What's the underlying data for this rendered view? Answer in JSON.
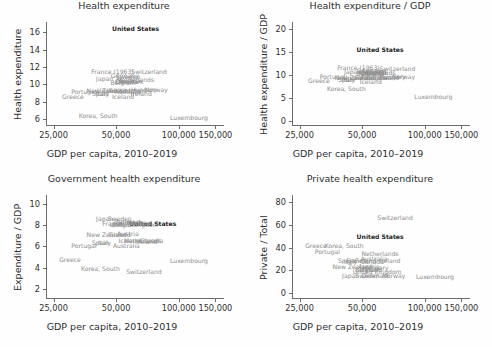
{
  "figure": {
    "background": "#fefefe",
    "label_color": "#8c8c8c",
    "highlight_color": "#1d1d1d",
    "axis_color": "#6b6b6b",
    "shared_xlabel": "GDP per capita, 2010–2019",
    "highlight_country": "United States"
  },
  "chart_data": [
    {
      "type": "scatter",
      "title": "Health expenditure",
      "xlabel": "GDP per capita, 2010–2019",
      "ylabel": "Health expenditure",
      "xscale": "log",
      "xlim": [
        23000,
        165000
      ],
      "ylim": [
        5.2,
        17.2
      ],
      "xticks": [
        25000,
        50000,
        100000,
        150000
      ],
      "xticklabels": [
        "25,000",
        "50,000",
        "100,000",
        "150,000"
      ],
      "yticks": [
        6,
        8,
        10,
        12,
        14,
        16
      ],
      "yticklabels": [
        "6",
        "8",
        "10",
        "12",
        "14",
        "16"
      ],
      "grid": false,
      "legend": "none",
      "marker_style": "country-name-text",
      "points": [
        {
          "label": "United States",
          "x": 62000,
          "y": 16.4,
          "highlight": true
        },
        {
          "label": "Switzerland",
          "x": 72000,
          "y": 11.4
        },
        {
          "label": "France (1963)",
          "x": 48000,
          "y": 11.4
        },
        {
          "label": "Germany",
          "x": 55000,
          "y": 11.0
        },
        {
          "label": "Sweden",
          "x": 57000,
          "y": 10.9
        },
        {
          "label": "Japan",
          "x": 44000,
          "y": 10.6
        },
        {
          "label": "Netherlands",
          "x": 62000,
          "y": 10.5
        },
        {
          "label": "Denmark",
          "x": 58000,
          "y": 10.3
        },
        {
          "label": "Austria",
          "x": 58000,
          "y": 10.4
        },
        {
          "label": "Belgium",
          "x": 54000,
          "y": 10.2
        },
        {
          "label": "Canada",
          "x": 56000,
          "y": 10.3
        },
        {
          "label": "Norway",
          "x": 78000,
          "y": 9.3
        },
        {
          "label": "Finland",
          "x": 52000,
          "y": 9.2
        },
        {
          "label": "New Zealand",
          "x": 45000,
          "y": 9.2
        },
        {
          "label": "Australia",
          "x": 57000,
          "y": 9.1
        },
        {
          "label": "United Kingdom",
          "x": 53000,
          "y": 9.2
        },
        {
          "label": "Italy",
          "x": 43000,
          "y": 8.9
        },
        {
          "label": "Spain",
          "x": 42000,
          "y": 8.9
        },
        {
          "label": "Portugal",
          "x": 35000,
          "y": 9.1
        },
        {
          "label": "Greece",
          "x": 31000,
          "y": 8.6
        },
        {
          "label": "Iceland",
          "x": 54000,
          "y": 8.5
        },
        {
          "label": "Ireland",
          "x": 66000,
          "y": 8.9
        },
        {
          "label": "Hungary",
          "x": 68000,
          "y": 9.3
        },
        {
          "label": "Korea, South",
          "x": 41000,
          "y": 6.4
        },
        {
          "label": "Luxembourg",
          "x": 112000,
          "y": 6.1
        }
      ]
    },
    {
      "type": "scatter",
      "title": "Health expenditure / GDP",
      "xlabel": "GDP per capita, 2010–2019",
      "ylabel": "Health expenditure / GDP",
      "xscale": "log",
      "xlim": [
        23000,
        165000
      ],
      "ylim": [
        -1.2,
        21.5
      ],
      "xticks": [
        25000,
        50000,
        100000,
        150000
      ],
      "xticklabels": [
        "25,000",
        "50,000",
        "100,000",
        "150,000"
      ],
      "yticks": [
        0,
        5,
        10,
        15,
        20
      ],
      "yticklabels": [
        "0",
        "5",
        "10",
        "15",
        "20"
      ],
      "grid": false,
      "legend": "none",
      "marker_style": "country-name-text",
      "points": [
        {
          "label": "United States",
          "x": 61000,
          "y": 15.4,
          "highlight": true
        },
        {
          "label": "Switzerland",
          "x": 74000,
          "y": 11.3
        },
        {
          "label": "France (1963)",
          "x": 48000,
          "y": 11.4
        },
        {
          "label": "Germany",
          "x": 55000,
          "y": 10.9
        },
        {
          "label": "Sweden",
          "x": 57000,
          "y": 10.9
        },
        {
          "label": "Japan",
          "x": 45000,
          "y": 10.5
        },
        {
          "label": "Netherlands",
          "x": 59000,
          "y": 10.4
        },
        {
          "label": "Denmark",
          "x": 57000,
          "y": 10.3
        },
        {
          "label": "Austria",
          "x": 58000,
          "y": 10.3
        },
        {
          "label": "Belgium",
          "x": 54000,
          "y": 10.2
        },
        {
          "label": "Canada",
          "x": 56000,
          "y": 10.2
        },
        {
          "label": "Norway",
          "x": 79000,
          "y": 9.5
        },
        {
          "label": "Finland",
          "x": 52000,
          "y": 9.3
        },
        {
          "label": "New Zealand",
          "x": 46000,
          "y": 9.3
        },
        {
          "label": "Australia",
          "x": 57000,
          "y": 9.2
        },
        {
          "label": "United Kingdom",
          "x": 53000,
          "y": 9.3
        },
        {
          "label": "Italy",
          "x": 43000,
          "y": 8.9
        },
        {
          "label": "Spain",
          "x": 42000,
          "y": 8.9
        },
        {
          "label": "Portugal",
          "x": 36000,
          "y": 9.4
        },
        {
          "label": "Greece",
          "x": 31000,
          "y": 8.6
        },
        {
          "label": "Iceland",
          "x": 55000,
          "y": 8.4
        },
        {
          "label": "Ireland",
          "x": 67000,
          "y": 9.3
        },
        {
          "label": "Hungary",
          "x": 70000,
          "y": 9.4
        },
        {
          "label": "Korea, South",
          "x": 42000,
          "y": 6.9
        },
        {
          "label": "Luxembourg",
          "x": 110000,
          "y": 5.2
        }
      ]
    },
    {
      "type": "scatter",
      "title": "Government health expenditure",
      "xlabel": "GDP per capita, 2010–2019",
      "ylabel": "Expenditure / GDP",
      "xscale": "log",
      "xlim": [
        23000,
        165000
      ],
      "ylim": [
        1.1,
        10.8
      ],
      "xticks": [
        25000,
        50000,
        100000,
        150000
      ],
      "xticklabels": [
        "25,000",
        "50,000",
        "100,000",
        "150,000"
      ],
      "yticks": [
        2,
        4,
        6,
        8,
        10
      ],
      "yticklabels": [
        "2",
        "4",
        "6",
        "8",
        "10"
      ],
      "grid": false,
      "legend": "none",
      "marker_style": "country-name-text",
      "points": [
        {
          "label": "United States",
          "x": 75000,
          "y": 8.1,
          "highlight": true
        },
        {
          "label": "Japan",
          "x": 44000,
          "y": 8.6
        },
        {
          "label": "Sweden",
          "x": 52000,
          "y": 8.6
        },
        {
          "label": "Denmark",
          "x": 57000,
          "y": 8.3
        },
        {
          "label": "Germany",
          "x": 58000,
          "y": 8.2
        },
        {
          "label": "France",
          "x": 48000,
          "y": 8.1
        },
        {
          "label": "Norway",
          "x": 64000,
          "y": 8.2
        },
        {
          "label": "Belgium",
          "x": 55000,
          "y": 8.0
        },
        {
          "label": "United Kingdom",
          "x": 61000,
          "y": 8.0
        },
        {
          "label": "Austria",
          "x": 57000,
          "y": 7.2
        },
        {
          "label": "New Zealand",
          "x": 45000,
          "y": 7.1
        },
        {
          "label": "Finland",
          "x": 52000,
          "y": 7.1
        },
        {
          "label": "Iceland",
          "x": 58000,
          "y": 6.5
        },
        {
          "label": "Netherlands",
          "x": 67000,
          "y": 6.5
        },
        {
          "label": "Canada",
          "x": 74000,
          "y": 6.5
        },
        {
          "label": "Ireland",
          "x": 70000,
          "y": 6.4
        },
        {
          "label": "Italy",
          "x": 44000,
          "y": 6.3
        },
        {
          "label": "Spain",
          "x": 42000,
          "y": 6.3
        },
        {
          "label": "Australia",
          "x": 56000,
          "y": 6.0
        },
        {
          "label": "Portugal",
          "x": 35000,
          "y": 6.0
        },
        {
          "label": "Greece",
          "x": 30000,
          "y": 4.7
        },
        {
          "label": "Korea, South",
          "x": 42000,
          "y": 3.9
        },
        {
          "label": "Switzerland",
          "x": 68000,
          "y": 3.6
        },
        {
          "label": "Luxembourg",
          "x": 112000,
          "y": 4.6
        }
      ]
    },
    {
      "type": "scatter",
      "title": "Private health expenditure",
      "xlabel": "GDP per capita, 2010–2019",
      "ylabel": "Private / Total",
      "xscale": "log",
      "xlim": [
        23000,
        165000
      ],
      "ylim": [
        -5,
        86
      ],
      "xticks": [
        25000,
        50000,
        100000,
        150000
      ],
      "xticklabels": [
        "25,000",
        "50,000",
        "100,000",
        "150,000"
      ],
      "yticks": [
        0,
        20,
        40,
        60,
        80
      ],
      "yticklabels": [
        "0",
        "20",
        "40",
        "60",
        "80"
      ],
      "grid": false,
      "legend": "none",
      "marker_style": "country-name-text",
      "points": [
        {
          "label": "Switzerland",
          "x": 72000,
          "y": 66
        },
        {
          "label": "United States",
          "x": 61000,
          "y": 49,
          "highlight": true
        },
        {
          "label": "Greece",
          "x": 30000,
          "y": 41
        },
        {
          "label": "Korea, South",
          "x": 41000,
          "y": 41
        },
        {
          "label": "Portugal",
          "x": 34000,
          "y": 36
        },
        {
          "label": "Netherlands",
          "x": 61000,
          "y": 34
        },
        {
          "label": "Australia",
          "x": 57000,
          "y": 30
        },
        {
          "label": "Spain",
          "x": 42000,
          "y": 28
        },
        {
          "label": "France",
          "x": 47000,
          "y": 28
        },
        {
          "label": "Finland",
          "x": 52000,
          "y": 28
        },
        {
          "label": "Ireland",
          "x": 68000,
          "y": 28
        },
        {
          "label": "Italy",
          "x": 44000,
          "y": 27
        },
        {
          "label": "Canada",
          "x": 56000,
          "y": 27
        },
        {
          "label": "New Zealand",
          "x": 45000,
          "y": 23
        },
        {
          "label": "Austria",
          "x": 54000,
          "y": 23
        },
        {
          "label": "Hungary",
          "x": 58000,
          "y": 22
        },
        {
          "label": "Belgium",
          "x": 53000,
          "y": 20
        },
        {
          "label": "Iceland",
          "x": 55000,
          "y": 20
        },
        {
          "label": "United Kingdom",
          "x": 59000,
          "y": 19
        },
        {
          "label": "Japan",
          "x": 44000,
          "y": 15
        },
        {
          "label": "Sweden",
          "x": 53000,
          "y": 15
        },
        {
          "label": "Denmark",
          "x": 58000,
          "y": 15
        },
        {
          "label": "Norway",
          "x": 71000,
          "y": 15
        },
        {
          "label": "Luxembourg",
          "x": 112000,
          "y": 14
        }
      ]
    }
  ]
}
